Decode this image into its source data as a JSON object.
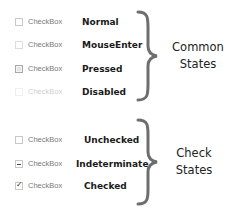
{
  "common_states": {
    "title_line1": "Common",
    "title_line2": "States",
    "rows": [
      {
        "checkbox_label": "CheckBox",
        "state": "Normal",
        "checkbox_style": "normal"
      },
      {
        "checkbox_label": "CheckBox",
        "state": "MouseEnter",
        "checkbox_style": "hover"
      },
      {
        "checkbox_label": "CheckBox",
        "state": "Pressed",
        "checkbox_style": "pressed"
      },
      {
        "checkbox_label": "CheckBox",
        "state": "Disabled",
        "checkbox_style": "disabled"
      }
    ]
  },
  "check_states": {
    "title_line1": "Check",
    "title_line2": "States",
    "rows": [
      {
        "checkbox_label": "CheckBox",
        "state": "Unchecked",
        "checkbox_style": "unchecked"
      },
      {
        "checkbox_label": "CheckBox",
        "state": "Indeterminate",
        "checkbox_style": "indeterminate"
      },
      {
        "checkbox_label": "CheckBox",
        "state": "Checked",
        "checkbox_style": "checked",
        "mark": "✓"
      }
    ]
  },
  "colors": {
    "brace": "#6e6e6e",
    "state_text": "#1a1a1a",
    "checkbox_label": "#7a7a7a"
  }
}
